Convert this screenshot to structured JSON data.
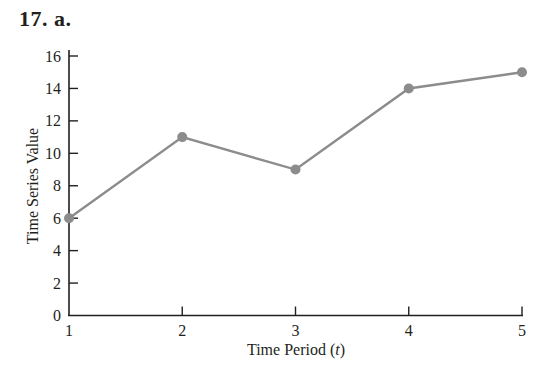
{
  "header": {
    "problem_label": "17.  a."
  },
  "chart_data": {
    "type": "line",
    "title": "",
    "xlabel": "Time Period (t)",
    "xlabel_main": "Time Period (",
    "xlabel_var": "t",
    "xlabel_close": ")",
    "ylabel": "Time Series Value",
    "x": [
      1,
      2,
      3,
      4,
      5
    ],
    "series": [
      {
        "name": "Time Series",
        "values": [
          6,
          11,
          9,
          14,
          15
        ],
        "color": "#8c8c8c"
      }
    ],
    "xlim": [
      1,
      5
    ],
    "ylim": [
      0,
      16
    ],
    "xticks": [
      1,
      2,
      3,
      4,
      5
    ],
    "yticks": [
      0,
      2,
      4,
      6,
      8,
      10,
      12,
      14,
      16
    ],
    "grid": false,
    "legend": "none",
    "marker": "circle"
  }
}
